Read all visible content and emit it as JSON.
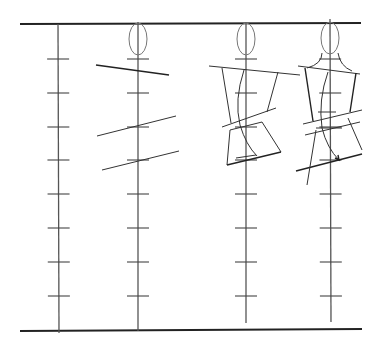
{
  "diagram": {
    "title": "",
    "background": "#ffffff",
    "ink_color": "#333333",
    "guides": {
      "top": {
        "x1": 20,
        "y1": 24,
        "x2": 361,
        "y2": 23
      },
      "bottom": {
        "x1": 20,
        "y1": 331,
        "x2": 362,
        "y2": 329
      }
    },
    "tick_rows_y": [
      59,
      93,
      127,
      160,
      194,
      228,
      262,
      296
    ],
    "figures": [
      {
        "name": "proportion-scale",
        "axis": {
          "x1": 58,
          "y1": 24,
          "x2": 59,
          "y2": 333
        },
        "tick_half_width": 11,
        "head": null,
        "strokes": []
      },
      {
        "name": "head-and-landmark-lines",
        "axis": {
          "x1": 138,
          "y1": 22,
          "x2": 138,
          "y2": 331
        },
        "tick_half_width": 11,
        "head": {
          "cx": 138,
          "cy": 39,
          "rx": 9,
          "ry": 16
        },
        "strokes": [
          {
            "d": "M96 65 L169 75",
            "weight": "bold"
          },
          {
            "d": "M97 136 L176 116",
            "weight": "normal"
          },
          {
            "d": "M102 170 L179 151",
            "weight": "normal"
          }
        ]
      },
      {
        "name": "torso-block-figure",
        "axis": {
          "x1": 246,
          "y1": 22,
          "x2": 246,
          "y2": 323
        },
        "tick_half_width": 11,
        "head": {
          "cx": 246,
          "cy": 39,
          "rx": 9,
          "ry": 16
        },
        "strokes": [
          {
            "d": "M209 66 L300 75",
            "weight": "normal"
          },
          {
            "d": "M222 68 L231 123",
            "weight": "normal"
          },
          {
            "d": "M278 72 L267 112",
            "weight": "normal"
          },
          {
            "d": "M222 127 L276 108",
            "weight": "normal"
          },
          {
            "d": "M230 130 L262 122",
            "weight": "normal"
          },
          {
            "d": "M230 130 L227 165",
            "weight": "normal"
          },
          {
            "d": "M262 122 L281 152",
            "weight": "normal"
          },
          {
            "d": "M227 165 L281 152",
            "weight": "bold"
          },
          {
            "d": "M244 70 Q234 100 240 125 Q246 145 257 156",
            "weight": "normal"
          },
          {
            "d": "M236 158 L256 155",
            "weight": "normal"
          }
        ]
      },
      {
        "name": "refined-figure",
        "axis": {
          "x1": 330,
          "y1": 19,
          "x2": 331,
          "y2": 322
        },
        "tick_half_width": 11,
        "head": {
          "cx": 330,
          "cy": 38,
          "rx": 9,
          "ry": 16
        },
        "strokes": [
          {
            "d": "M322 53 Q322 64 307 68",
            "weight": "normal"
          },
          {
            "d": "M338 53 Q340 66 352 71",
            "weight": "normal"
          },
          {
            "d": "M298 66 L360 74",
            "weight": "normal"
          },
          {
            "d": "M305 68 L313 121",
            "weight": "bold"
          },
          {
            "d": "M356 73 L350 112",
            "weight": "bold"
          },
          {
            "d": "M303 124 L362 110",
            "weight": "normal"
          },
          {
            "d": "M305 135 L360 122",
            "weight": "normal"
          },
          {
            "d": "M296 171 L362 154",
            "weight": "bold"
          },
          {
            "d": "M316 130 L307 185",
            "weight": "normal"
          },
          {
            "d": "M348 118 L362 150",
            "weight": "normal"
          },
          {
            "d": "M328 72 Q318 100 322 128 Q327 148 339 160",
            "weight": "normal"
          },
          {
            "d": "M335 158 L339 160 L338 155",
            "weight": "bold"
          },
          {
            "d": "M318 112 L336 112",
            "weight": "normal"
          },
          {
            "d": "M316 128 L342 128",
            "weight": "normal"
          }
        ]
      }
    ]
  }
}
